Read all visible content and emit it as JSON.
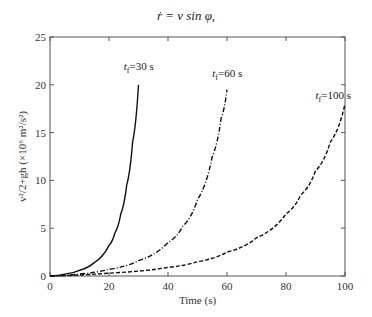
{
  "header": {
    "equation": "ṙ = v sin φ,"
  },
  "chart_data": {
    "type": "line",
    "title": "",
    "xlabel": "Time (s)",
    "ylabel": "v²/2+gh (×10⁶ m²/s²)",
    "xlim": [
      0,
      100
    ],
    "ylim": [
      0,
      25
    ],
    "xticks": [
      0,
      20,
      40,
      60,
      80,
      100
    ],
    "yticks": [
      0,
      5,
      10,
      15,
      20,
      25
    ],
    "grid": false,
    "legend": "none (inline annotations)",
    "series": [
      {
        "name": "t_f=30 s",
        "style": "solid",
        "x": [
          0,
          5,
          10,
          15,
          20,
          22,
          24,
          26,
          28,
          30
        ],
        "y": [
          0,
          0.2,
          0.6,
          1.4,
          3.2,
          4.5,
          6.5,
          9.5,
          14,
          20
        ]
      },
      {
        "name": "t_f=60 s",
        "style": "dash-dot",
        "x": [
          0,
          10,
          20,
          30,
          40,
          45,
          50,
          55,
          58,
          60
        ],
        "y": [
          0,
          0.2,
          0.7,
          1.6,
          3.5,
          5.2,
          8,
          12.5,
          16.5,
          19.5
        ]
      },
      {
        "name": "t_f=100 s",
        "style": "dashed",
        "x": [
          0,
          20,
          40,
          50,
          60,
          70,
          80,
          85,
          90,
          95,
          100
        ],
        "y": [
          0,
          0.3,
          0.9,
          1.5,
          2.5,
          4,
          6.5,
          8.5,
          11,
          14,
          18
        ]
      }
    ],
    "annotations": [
      {
        "text_base": "t",
        "text_sub": "f",
        "text_rest": "=30 s",
        "x": 25,
        "y": 21.5
      },
      {
        "text_base": "t",
        "text_sub": "f",
        "text_rest": "=60 s",
        "x": 55,
        "y": 20.8
      },
      {
        "text_base": "t",
        "text_sub": "f",
        "text_rest": "=100 s",
        "x": 90,
        "y": 18.5
      }
    ]
  }
}
